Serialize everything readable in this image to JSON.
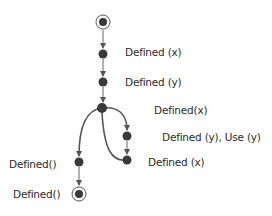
{
  "diagram": {
    "type": "control-flow-graph",
    "colors": {
      "node": "#3a3a3a",
      "edge": "#555555",
      "text": "#2a2a2a",
      "background": "#ffffff"
    },
    "nodes": [
      {
        "id": "start",
        "kind": "initial",
        "x": 103,
        "y": 22,
        "label": ""
      },
      {
        "id": "n1",
        "kind": "action",
        "x": 103,
        "y": 54,
        "label": "Defined (x)"
      },
      {
        "id": "n2",
        "kind": "action",
        "x": 103,
        "y": 82,
        "label": "Defined (y)"
      },
      {
        "id": "n3",
        "kind": "branch",
        "x": 102,
        "y": 108,
        "label": "Defined(x)"
      },
      {
        "id": "n4",
        "kind": "action",
        "x": 127,
        "y": 136,
        "label": "Defined (y), Use (y)"
      },
      {
        "id": "n5",
        "kind": "action",
        "x": 127,
        "y": 160,
        "label": "Defined (x)"
      },
      {
        "id": "n6",
        "kind": "action",
        "x": 79,
        "y": 162,
        "label": "Defined()"
      },
      {
        "id": "end",
        "kind": "final",
        "x": 79,
        "y": 194,
        "label": "Defined()"
      }
    ],
    "edges": [
      {
        "from": "start",
        "to": "n1"
      },
      {
        "from": "n1",
        "to": "n2"
      },
      {
        "from": "n2",
        "to": "n3"
      },
      {
        "from": "n3",
        "to": "n4"
      },
      {
        "from": "n4",
        "to": "n5"
      },
      {
        "from": "n5",
        "to": "n3"
      },
      {
        "from": "n3",
        "to": "n6"
      },
      {
        "from": "n6",
        "to": "end"
      }
    ]
  },
  "labels": {
    "n1": "Defined (x)",
    "n2": "Defined (y)",
    "n3": "Defined(x)",
    "n4": "Defined (y), Use (y)",
    "n5": "Defined (x)",
    "n6": "Defined()",
    "end": "Defined()"
  }
}
